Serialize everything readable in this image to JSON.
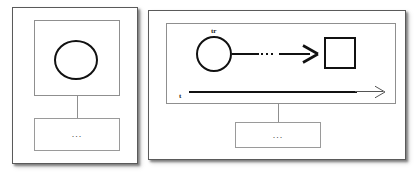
{
  "diagram": {
    "background_color": "#ffffff",
    "stroke_color": "#111111",
    "frame_color": "#5a5a5a",
    "inner_frame_color": "#8f8f8f",
    "left_panel": {
      "name": "left-panel",
      "inner_region_label": "",
      "circle_node_label": "",
      "child_box_text": "..."
    },
    "right_panel": {
      "name": "right-panel",
      "circle_node_label": "tr",
      "circle_node_label_base": "t",
      "circle_node_label_sub": "r",
      "edge_dots_text": "...",
      "time_axis_label": "t",
      "square_node_label": "",
      "child_box_text": "..."
    }
  }
}
